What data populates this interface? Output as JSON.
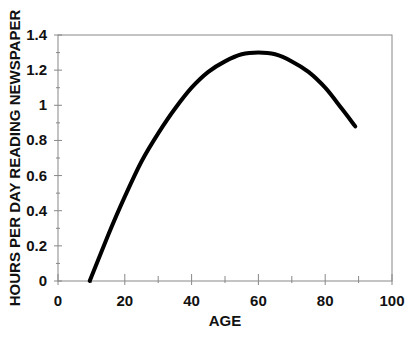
{
  "chart_data": {
    "type": "line",
    "title": "",
    "xlabel": "AGE",
    "ylabel": "HOURS PER DAY READING NEWSPAPER",
    "xlim": [
      0,
      100
    ],
    "ylim": [
      0,
      1.4
    ],
    "x_ticks": [
      0,
      20,
      40,
      60,
      80,
      100
    ],
    "x_tick_labels": [
      "0",
      "20",
      "40",
      "60",
      "80",
      "100"
    ],
    "y_ticks": [
      0,
      0.2,
      0.4,
      0.6,
      0.8,
      1,
      1.2,
      1.4
    ],
    "y_tick_labels": [
      "0",
      "0.2",
      "0.4",
      "0.6",
      "0.8",
      "1",
      "1.2",
      "1.4"
    ],
    "x_minor_step": 10,
    "y_minor_step": 0.1,
    "grid": false,
    "legend": null,
    "series": [
      {
        "name": "Hours per day reading newspaper",
        "x": [
          9.5,
          15,
          20,
          25,
          30,
          35,
          40,
          45,
          50,
          55,
          60,
          65,
          70,
          75,
          80,
          85,
          89
        ],
        "values": [
          0.0,
          0.26,
          0.48,
          0.68,
          0.84,
          0.98,
          1.1,
          1.19,
          1.25,
          1.29,
          1.3,
          1.29,
          1.25,
          1.19,
          1.1,
          0.98,
          0.88
        ]
      }
    ],
    "colors": {
      "line": "#000000",
      "axis": "#888888",
      "text": "#111111"
    }
  }
}
